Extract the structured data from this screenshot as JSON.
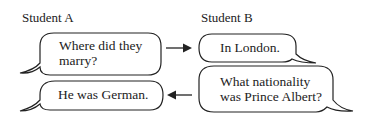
{
  "speakers": {
    "a": "Student A",
    "b": "Student B"
  },
  "bubbles": {
    "a1": {
      "lines": [
        "Where did they",
        "marry?"
      ],
      "speaker": "Student A"
    },
    "b1": {
      "lines": [
        "In London."
      ],
      "speaker": "Student B"
    },
    "b2": {
      "lines": [
        "What nationality",
        "was Prince Albert?"
      ],
      "speaker": "Student B"
    },
    "a2": {
      "lines": [
        "He was German."
      ],
      "speaker": "Student A"
    }
  },
  "arrows": [
    {
      "from": "a1",
      "to": "b1",
      "direction": "right"
    },
    {
      "from": "b2",
      "to": "a2",
      "direction": "left"
    }
  ],
  "colors": {
    "stroke": "#222222",
    "text": "#222222",
    "background": "#ffffff"
  }
}
